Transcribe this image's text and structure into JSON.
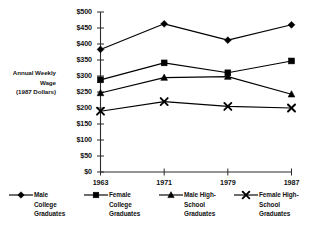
{
  "chart_data": {
    "type": "line",
    "title": "",
    "xlabel": "",
    "ylabel": "Annual Weekly Wage (1987 Dollars)",
    "ylabel_lines": [
      "Annual Weekly",
      "Wage",
      "(1987 Dollars)"
    ],
    "categories": [
      "1963",
      "1971",
      "1979",
      "1987"
    ],
    "x": [
      1963,
      1971,
      1979,
      1987
    ],
    "ylim": [
      0,
      500
    ],
    "yticks": [
      0,
      50,
      100,
      150,
      200,
      250,
      300,
      350,
      400,
      450,
      500
    ],
    "ytick_labels": [
      "$0",
      "$50",
      "$100",
      "$150",
      "$200",
      "$250",
      "$300",
      "$350",
      "$400",
      "$450",
      "$500"
    ],
    "grid": false,
    "legend_position": "bottom",
    "series": [
      {
        "name": "Male College Graduates",
        "name_lines": [
          "Male",
          "College",
          "Graduates"
        ],
        "marker": "diamond",
        "color": "#000000",
        "values": [
          383,
          463,
          412,
          460
        ]
      },
      {
        "name": "Female College Graduates",
        "name_lines": [
          "Female",
          "College",
          "Graduates"
        ],
        "marker": "square",
        "color": "#000000",
        "values": [
          288,
          341,
          310,
          347
        ]
      },
      {
        "name": "Male High-School Graduates",
        "name_lines": [
          "Male High-",
          "School",
          "Graduates"
        ],
        "marker": "triangle",
        "color": "#000000",
        "values": [
          247,
          295,
          298,
          243
        ]
      },
      {
        "name": "Female High-School Graduates",
        "name_lines": [
          "Female High-",
          "School",
          "Graduates"
        ],
        "marker": "cross",
        "color": "#000000",
        "values": [
          190,
          220,
          205,
          200
        ]
      }
    ]
  },
  "axis": {
    "line_color": "#2b2b2b"
  }
}
